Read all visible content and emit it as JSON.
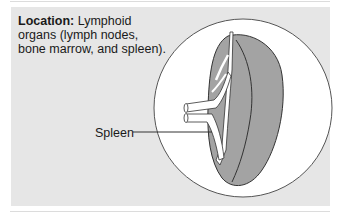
{
  "caption": {
    "heading": "Location:",
    "text": " Lymphoid organs (lymph nodes, bone marrow, and spleen)."
  },
  "diagram": {
    "labels": [
      {
        "text": "Spleen",
        "target": "spleen"
      }
    ],
    "colors": {
      "panel": "#e6e6e6",
      "circle_fill": "#ffffff",
      "organ": "#a3a3a3",
      "outline": "#333333"
    }
  }
}
